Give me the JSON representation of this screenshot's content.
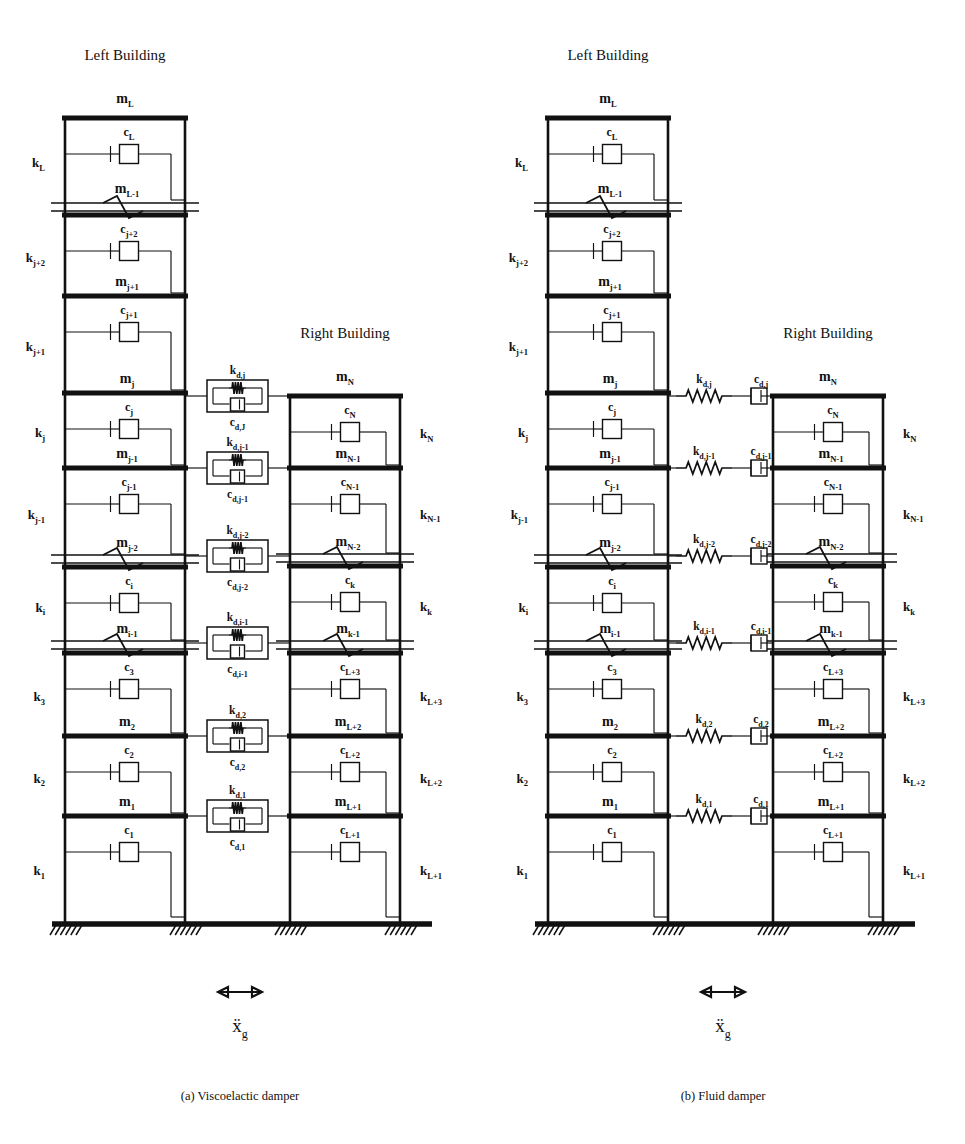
{
  "figure": {
    "caption_a": "(a) Viscoelactic damper",
    "caption_b": "(b) Fluid damper",
    "ground_excitation": "x",
    "ground_excitation_sub": "g"
  },
  "panel_a": {
    "damper_type": "viscoelastic",
    "left_building": {
      "title": "Left Building",
      "top_mass": "m",
      "top_mass_sub": "L",
      "stories": [
        {
          "k": "k",
          "k_sub": "L",
          "c": "c",
          "c_sub": "L",
          "m": "m",
          "m_sub": "L-1"
        },
        {
          "k": "k",
          "k_sub": "j+2",
          "c": "c",
          "c_sub": "j+2",
          "m": "m",
          "m_sub": "j+1"
        },
        {
          "k": "k",
          "k_sub": "j+1",
          "c": "c",
          "c_sub": "j+1",
          "m": "m",
          "m_sub": "j"
        },
        {
          "k": "k",
          "k_sub": "j",
          "c": "c",
          "c_sub": "j",
          "m": "m",
          "m_sub": "j-1"
        },
        {
          "k": "k",
          "k_sub": "j-1",
          "c": "c",
          "c_sub": "j-1",
          "m": "m",
          "m_sub": "j-2"
        },
        {
          "k": "k",
          "k_sub": "i",
          "c": "c",
          "c_sub": "i",
          "m": "m",
          "m_sub": "i-1"
        },
        {
          "k": "k",
          "k_sub": "3",
          "c": "c",
          "c_sub": "3",
          "m": "m",
          "m_sub": "2"
        },
        {
          "k": "k",
          "k_sub": "2",
          "c": "c",
          "c_sub": "2",
          "m": "m",
          "m_sub": "1"
        },
        {
          "k": "k",
          "k_sub": "1",
          "c": "c",
          "c_sub": "1",
          "m": "",
          "m_sub": ""
        }
      ]
    },
    "right_building": {
      "title": "Right Building",
      "top_mass": "m",
      "top_mass_sub": "N",
      "stories": [
        {
          "k": "k",
          "k_sub": "N",
          "c": "c",
          "c_sub": "N",
          "m": "m",
          "m_sub": "N-1"
        },
        {
          "k": "k",
          "k_sub": "N-1",
          "c": "c",
          "c_sub": "N-1",
          "m": "m",
          "m_sub": "N-2"
        },
        {
          "k": "k",
          "k_sub": "k",
          "c": "c",
          "c_sub": "k",
          "m": "m",
          "m_sub": "k-1"
        },
        {
          "k": "k",
          "k_sub": "L+3",
          "c": "c",
          "c_sub": "L+3",
          "m": "m",
          "m_sub": "L+2"
        },
        {
          "k": "k",
          "k_sub": "L+2",
          "c": "c",
          "c_sub": "L+2",
          "m": "m",
          "m_sub": "L+1"
        },
        {
          "k": "k",
          "k_sub": "L+1",
          "c": "c",
          "c_sub": "L+1",
          "m": "",
          "m_sub": ""
        }
      ]
    },
    "dampers": [
      {
        "k": "k",
        "k_sub": "d,j",
        "c": "c",
        "c_sub": "d,J"
      },
      {
        "k": "k",
        "k_sub": "d,j-1",
        "c": "c",
        "c_sub": "d,j-1"
      },
      {
        "k": "k",
        "k_sub": "d,j-2",
        "c": "c",
        "c_sub": "d,j-2"
      },
      {
        "k": "k",
        "k_sub": "d,i-1",
        "c": "c",
        "c_sub": "d,i-1"
      },
      {
        "k": "k",
        "k_sub": "d,2",
        "c": "c",
        "c_sub": "d,2"
      },
      {
        "k": "k",
        "k_sub": "d,1",
        "c": "c",
        "c_sub": "d,1"
      }
    ]
  },
  "panel_b": {
    "damper_type": "fluid",
    "left_building": {
      "title": "Left Building",
      "top_mass": "m",
      "top_mass_sub": "L",
      "stories": [
        {
          "k": "k",
          "k_sub": "L",
          "c": "c",
          "c_sub": "L",
          "m": "m",
          "m_sub": "L-1"
        },
        {
          "k": "k",
          "k_sub": "j+2",
          "c": "c",
          "c_sub": "j+2",
          "m": "m",
          "m_sub": "j+1"
        },
        {
          "k": "k",
          "k_sub": "j+1",
          "c": "c",
          "c_sub": "j+1",
          "m": "m",
          "m_sub": "j"
        },
        {
          "k": "k",
          "k_sub": "j",
          "c": "c",
          "c_sub": "j",
          "m": "m",
          "m_sub": "j-1"
        },
        {
          "k": "k",
          "k_sub": "j-1",
          "c": "c",
          "c_sub": "j-1",
          "m": "m",
          "m_sub": "j-2"
        },
        {
          "k": "k",
          "k_sub": "i",
          "c": "c",
          "c_sub": "i",
          "m": "m",
          "m_sub": "i-1"
        },
        {
          "k": "k",
          "k_sub": "3",
          "c": "c",
          "c_sub": "3",
          "m": "m",
          "m_sub": "2"
        },
        {
          "k": "k",
          "k_sub": "2",
          "c": "c",
          "c_sub": "2",
          "m": "m",
          "m_sub": "1"
        },
        {
          "k": "k",
          "k_sub": "1",
          "c": "c",
          "c_sub": "1",
          "m": "",
          "m_sub": ""
        }
      ]
    },
    "right_building": {
      "title": "Right Building",
      "top_mass": "m",
      "top_mass_sub": "N",
      "stories": [
        {
          "k": "k",
          "k_sub": "N",
          "c": "c",
          "c_sub": "N",
          "m": "m",
          "m_sub": "N-1"
        },
        {
          "k": "k",
          "k_sub": "N-1",
          "c": "c",
          "c_sub": "N-1",
          "m": "m",
          "m_sub": "N-2"
        },
        {
          "k": "k",
          "k_sub": "k",
          "c": "c",
          "c_sub": "k",
          "m": "m",
          "m_sub": "k-1"
        },
        {
          "k": "k",
          "k_sub": "L+3",
          "c": "c",
          "c_sub": "L+3",
          "m": "m",
          "m_sub": "L+2"
        },
        {
          "k": "k",
          "k_sub": "L+2",
          "c": "c",
          "c_sub": "L+2",
          "m": "m",
          "m_sub": "L+1"
        },
        {
          "k": "k",
          "k_sub": "L+1",
          "c": "c",
          "c_sub": "L+1",
          "m": "",
          "m_sub": ""
        }
      ]
    },
    "dampers": [
      {
        "k": "k",
        "k_sub": "d,j",
        "c": "c",
        "c_sub": "d,j"
      },
      {
        "k": "k",
        "k_sub": "d,j-1",
        "c": "c",
        "c_sub": "d,j-1"
      },
      {
        "k": "k",
        "k_sub": "d,j-2",
        "c": "c",
        "c_sub": "d,j-2"
      },
      {
        "k": "k",
        "k_sub": "d,i-1",
        "c": "c",
        "c_sub": "d,i-1"
      },
      {
        "k": "k",
        "k_sub": "d,2",
        "c": "c",
        "c_sub": "d,2"
      },
      {
        "k": "k",
        "k_sub": "d,1",
        "c": "c",
        "c_sub": "d,1"
      }
    ]
  }
}
